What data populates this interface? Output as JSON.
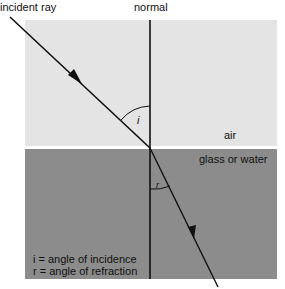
{
  "labels": {
    "incident_ray": "incident ray",
    "normal": "normal",
    "air": "air",
    "medium": "glass or water",
    "angle_i": "i",
    "angle_r": "r",
    "legend_i": "i = angle of incidence",
    "legend_r": "r = angle of refraction"
  },
  "colors": {
    "air": "#e4e4e4",
    "medium": "#8c8c8c",
    "line": "#111111"
  }
}
